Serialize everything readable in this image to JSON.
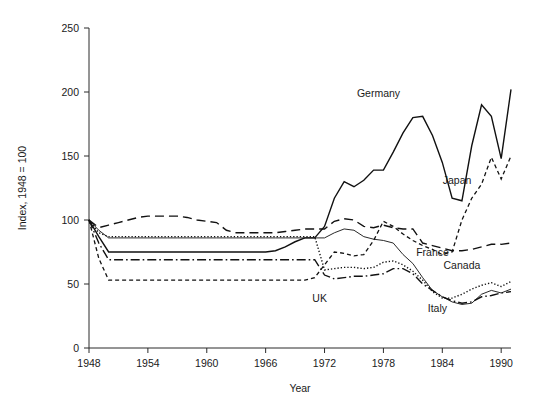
{
  "chart_data": {
    "type": "line",
    "title": "",
    "xlabel": "Year",
    "ylabel": "Index, 1948 = 100",
    "xlim": [
      1948,
      1991
    ],
    "ylim": [
      0,
      250
    ],
    "yticks": [
      0,
      50,
      100,
      150,
      200,
      250
    ],
    "ytick_labels": [
      "0",
      "50",
      "100",
      "150",
      "200",
      "250"
    ],
    "xticks": [
      1948,
      1954,
      1960,
      1966,
      1972,
      1978,
      1984,
      1990
    ],
    "xtick_labels": [
      "1948",
      "1954",
      "1960",
      "1966",
      "1972",
      "1978",
      "1984",
      "1990"
    ],
    "grid": false,
    "legend_position": "inline-annotations",
    "series": [
      {
        "name": "Germany",
        "style": "solid",
        "width": 1.4,
        "label": "Germany",
        "label_x": 1977.5,
        "label_y": 196,
        "x": [
          1948,
          1949,
          1950,
          1951,
          1952,
          1953,
          1954,
          1955,
          1956,
          1957,
          1958,
          1959,
          1960,
          1961,
          1962,
          1963,
          1964,
          1965,
          1966,
          1967,
          1968,
          1969,
          1970,
          1971,
          1972,
          1973,
          1974,
          1975,
          1976,
          1977,
          1978,
          1979,
          1980,
          1981,
          1982,
          1983,
          1984,
          1985,
          1986,
          1987,
          1988,
          1989,
          1990,
          1991
        ],
        "values": [
          100,
          87,
          75,
          75,
          75,
          75,
          75,
          75,
          75,
          75,
          75,
          75,
          75,
          75,
          75,
          75,
          75,
          75,
          75,
          76,
          79,
          83,
          86,
          86,
          95,
          117,
          130,
          126,
          131,
          139,
          139,
          153,
          168,
          180,
          181,
          166,
          145,
          117,
          115,
          158,
          190,
          181,
          148,
          202
        ]
      },
      {
        "name": "Japan",
        "style": "dashed",
        "width": 1.3,
        "label": "Japan",
        "label_x": 1985.5,
        "label_y": 128,
        "x": [
          1948,
          1949,
          1950,
          1951,
          1952,
          1953,
          1954,
          1955,
          1956,
          1957,
          1958,
          1959,
          1960,
          1961,
          1962,
          1963,
          1964,
          1965,
          1966,
          1967,
          1968,
          1969,
          1970,
          1971,
          1972,
          1973,
          1974,
          1975,
          1976,
          1977,
          1978,
          1979,
          1980,
          1981,
          1982,
          1983,
          1984,
          1985,
          1986,
          1987,
          1988,
          1989,
          1990,
          1991
        ],
        "values": [
          100,
          70,
          53,
          53,
          53,
          53,
          53,
          53,
          53,
          53,
          53,
          53,
          53,
          53,
          53,
          53,
          53,
          53,
          53,
          53,
          53,
          53,
          53,
          55,
          65,
          75,
          74,
          72,
          73,
          84,
          99,
          95,
          89,
          84,
          80,
          77,
          73,
          75,
          100,
          117,
          128,
          149,
          132,
          150
        ]
      },
      {
        "name": "Canada",
        "style": "longdash",
        "width": 1.4,
        "label": "Canada",
        "label_x": 1986,
        "label_y": 62,
        "x": [
          1948,
          1949,
          1950,
          1951,
          1952,
          1953,
          1954,
          1955,
          1956,
          1957,
          1958,
          1959,
          1960,
          1961,
          1962,
          1963,
          1964,
          1965,
          1966,
          1967,
          1968,
          1969,
          1970,
          1971,
          1972,
          1973,
          1974,
          1975,
          1976,
          1977,
          1978,
          1979,
          1980,
          1981,
          1982,
          1983,
          1984,
          1985,
          1986,
          1987,
          1988,
          1989,
          1990,
          1991
        ],
        "values": [
          100,
          94,
          96,
          98,
          100,
          102,
          103,
          103,
          103,
          103,
          102,
          100,
          99,
          98,
          92,
          90,
          90,
          90,
          90,
          90,
          91,
          92,
          93,
          93,
          93,
          99,
          101,
          100,
          95,
          94,
          96,
          94,
          93,
          93,
          82,
          80,
          78,
          76,
          76,
          77,
          79,
          81,
          81,
          82
        ]
      },
      {
        "name": "France",
        "style": "dotted",
        "width": 1.4,
        "label": "France",
        "label_x": 1983,
        "label_y": 72,
        "x": [
          1948,
          1949,
          1950,
          1951,
          1952,
          1953,
          1954,
          1955,
          1956,
          1957,
          1958,
          1959,
          1960,
          1961,
          1962,
          1963,
          1964,
          1965,
          1966,
          1967,
          1968,
          1969,
          1970,
          1971,
          1972,
          1973,
          1974,
          1975,
          1976,
          1977,
          1978,
          1979,
          1980,
          1981,
          1982,
          1983,
          1984,
          1985,
          1986,
          1987,
          1988,
          1989,
          1990,
          1991
        ],
        "values": [
          100,
          90,
          87,
          87,
          87,
          87,
          87,
          87,
          87,
          87,
          87,
          87,
          87,
          87,
          87,
          87,
          87,
          87,
          87,
          87,
          87,
          87,
          87,
          87,
          61,
          62,
          63,
          63,
          62,
          63,
          67,
          68,
          65,
          60,
          53,
          44,
          39,
          39,
          42,
          46,
          49,
          51,
          48,
          52
        ]
      },
      {
        "name": "UK",
        "style": "dashdot",
        "width": 1.4,
        "label": "UK",
        "label_x": 1971.5,
        "label_y": 36,
        "x": [
          1948,
          1949,
          1950,
          1951,
          1952,
          1953,
          1954,
          1955,
          1956,
          1957,
          1958,
          1959,
          1960,
          1961,
          1962,
          1963,
          1964,
          1965,
          1966,
          1967,
          1968,
          1969,
          1970,
          1971,
          1972,
          1973,
          1974,
          1975,
          1976,
          1977,
          1978,
          1979,
          1980,
          1981,
          1982,
          1983,
          1984,
          1985,
          1986,
          1987,
          1988,
          1989,
          1990,
          1991
        ],
        "values": [
          100,
          82,
          69,
          69,
          69,
          69,
          69,
          69,
          69,
          69,
          69,
          69,
          69,
          69,
          69,
          69,
          69,
          69,
          69,
          69,
          69,
          69,
          69,
          69,
          57,
          54,
          55,
          56,
          56,
          57,
          58,
          62,
          62,
          58,
          50,
          45,
          40,
          37,
          35,
          36,
          40,
          41,
          43,
          44
        ]
      },
      {
        "name": "Italy",
        "style": "solid-thin",
        "width": 0.9,
        "label": "Italy",
        "label_x": 1983.5,
        "label_y": 28,
        "x": [
          1948,
          1949,
          1950,
          1951,
          1952,
          1953,
          1954,
          1955,
          1956,
          1957,
          1958,
          1959,
          1960,
          1961,
          1962,
          1963,
          1964,
          1965,
          1966,
          1967,
          1968,
          1969,
          1970,
          1971,
          1972,
          1973,
          1974,
          1975,
          1976,
          1977,
          1978,
          1979,
          1980,
          1981,
          1982,
          1983,
          1984,
          1985,
          1986,
          1987,
          1988,
          1989,
          1990,
          1991
        ],
        "values": [
          100,
          92,
          86,
          86,
          86,
          86,
          86,
          86,
          86,
          86,
          86,
          86,
          86,
          86,
          86,
          86,
          86,
          86,
          86,
          86,
          86,
          86,
          86,
          86,
          86,
          90,
          93,
          92,
          87,
          85,
          84,
          82,
          73,
          66,
          55,
          45,
          40,
          36,
          34,
          35,
          42,
          45,
          43,
          46
        ]
      }
    ]
  },
  "axes": {
    "geometry": {
      "left": 89,
      "right": 511,
      "top": 28,
      "bottom": 348
    }
  }
}
